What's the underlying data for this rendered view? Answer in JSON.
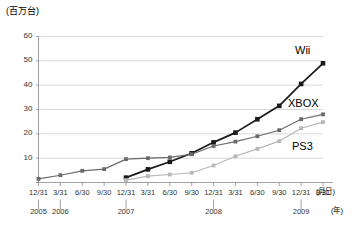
{
  "chart_data": {
    "type": "line",
    "title": "",
    "subtitle": "",
    "ylabel": "(百万台)",
    "xlabel": "(月日)",
    "xlabel2": "(年)",
    "ylim": [
      0,
      60
    ],
    "yticks": [
      0,
      10,
      20,
      30,
      40,
      50,
      60
    ],
    "ytick_labels": [
      "",
      "10",
      "20",
      "30",
      "40",
      "50",
      "60"
    ],
    "grid": true,
    "legend_position": "inline-right",
    "x": [
      "12/31",
      "3/31",
      "6/30",
      "9/30",
      "12/31",
      "3/31",
      "6/30",
      "9/30",
      "12/31",
      "3/31",
      "6/30",
      "9/30",
      "12/31",
      "3/31"
    ],
    "year_marks": [
      {
        "index": 0,
        "label": "2005"
      },
      {
        "index": 1,
        "label": "2006"
      },
      {
        "index": 4,
        "label": "2007"
      },
      {
        "index": 8,
        "label": "2008"
      },
      {
        "index": 12,
        "label": "2009"
      }
    ],
    "series": [
      {
        "name": "Wii",
        "color": "#1a1a1a",
        "start_index": 4,
        "values": [
          null,
          null,
          null,
          null,
          2.0,
          5.4,
          8.5,
          12.0,
          16.5,
          20.5,
          26.0,
          31.5,
          40.5,
          49.0
        ]
      },
      {
        "name": "XBOX",
        "color": "#6b6b6b",
        "start_index": 0,
        "values": [
          1.5,
          3.0,
          4.8,
          5.5,
          9.6,
          10.0,
          10.3,
          11.6,
          15.0,
          16.8,
          19.0,
          21.5,
          26.0,
          28.0
        ]
      },
      {
        "name": "PS3",
        "color": "#b8b8b8",
        "start_index": 4,
        "values": [
          null,
          null,
          null,
          null,
          1.0,
          2.6,
          3.3,
          4.0,
          7.0,
          10.8,
          13.8,
          17.0,
          22.3,
          24.8
        ]
      }
    ]
  }
}
